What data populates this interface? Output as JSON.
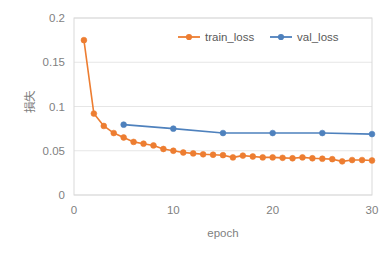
{
  "chart_data": {
    "type": "line",
    "title": "",
    "xlabel": "epoch",
    "ylabel": "損失",
    "xlim": [
      0,
      30
    ],
    "ylim": [
      0,
      0.2
    ],
    "xticks": [
      "0",
      "10",
      "20",
      "30"
    ],
    "xtick_values": [
      0,
      10,
      20,
      30
    ],
    "yticks": [
      "0",
      "0.05",
      "0.1",
      "0.15",
      "0.2"
    ],
    "ytick_values": [
      0,
      0.05,
      0.1,
      0.15,
      0.2
    ],
    "grid": "horizontal",
    "legend_position": "top-center",
    "markers": "circle",
    "series": [
      {
        "name": "train_loss",
        "color": "#ED7D31",
        "x": [
          1,
          2,
          3,
          4,
          5,
          6,
          7,
          8,
          9,
          10,
          11,
          12,
          13,
          14,
          15,
          16,
          17,
          18,
          19,
          20,
          21,
          22,
          23,
          24,
          25,
          26,
          27,
          28,
          29,
          30
        ],
        "values": [
          0.175,
          0.092,
          0.078,
          0.07,
          0.065,
          0.06,
          0.058,
          0.056,
          0.052,
          0.05,
          0.048,
          0.047,
          0.046,
          0.0455,
          0.045,
          0.0425,
          0.0445,
          0.0435,
          0.0425,
          0.0425,
          0.042,
          0.0415,
          0.0425,
          0.0415,
          0.041,
          0.0405,
          0.038,
          0.0395,
          0.0395,
          0.039
        ]
      },
      {
        "name": "val_loss",
        "color": "#4E81BD",
        "x": [
          5,
          10,
          15,
          20,
          25,
          30
        ],
        "values": [
          0.0795,
          0.075,
          0.07,
          0.07,
          0.07,
          0.0688
        ]
      }
    ]
  },
  "legend": {
    "items": [
      {
        "label": "train_loss",
        "color": "#ED7D31"
      },
      {
        "label": "val_loss",
        "color": "#4E81BD"
      }
    ]
  },
  "axes": {
    "x_title": "epoch",
    "y_title": "損失"
  }
}
